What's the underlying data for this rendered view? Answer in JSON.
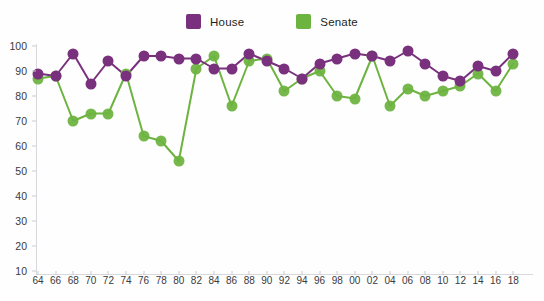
{
  "legend": {
    "entries": [
      {
        "label": "House",
        "color": "#79307d",
        "icon": "square-swatch-icon"
      },
      {
        "label": "Senate",
        "color": "#6db33f",
        "icon": "square-swatch-icon"
      }
    ]
  },
  "axes": {
    "y_ticks": [
      "100",
      "90",
      "80",
      "70",
      "60",
      "50",
      "40",
      "30",
      "20",
      "10"
    ],
    "x_ticks": [
      "64",
      "66",
      "68",
      "70",
      "72",
      "74",
      "76",
      "78",
      "80",
      "82",
      "84",
      "86",
      "88",
      "90",
      "92",
      "94",
      "96",
      "98",
      "00",
      "02",
      "04",
      "06",
      "08",
      "10",
      "12",
      "14",
      "16",
      "18"
    ]
  },
  "chart_data": {
    "type": "line",
    "title": "",
    "subtitle": "",
    "xlabel": "",
    "ylabel": "",
    "xlim": [
      64,
      18
    ],
    "ylim": [
      0,
      100
    ],
    "y_tick_values": [
      100,
      90,
      80,
      70,
      60,
      50,
      40,
      30,
      20,
      10
    ],
    "grid": false,
    "legend_position": "top-center",
    "markers": "filled-circle",
    "categories": [
      "64",
      "66",
      "68",
      "70",
      "72",
      "74",
      "76",
      "78",
      "80",
      "82",
      "84",
      "86",
      "88",
      "90",
      "92",
      "94",
      "96",
      "98",
      "00",
      "02",
      "04",
      "06",
      "08",
      "10",
      "12",
      "14",
      "16",
      "18"
    ],
    "series": [
      {
        "name": "House",
        "color": "#79307d",
        "values": [
          89,
          88,
          97,
          85,
          94,
          88,
          96,
          96,
          95,
          95,
          91,
          91,
          97,
          94,
          91,
          87,
          93,
          95,
          97,
          96,
          94,
          98,
          93,
          88,
          86,
          92,
          90,
          97
        ]
      },
      {
        "name": "Senate",
        "color": "#6db33f",
        "values": [
          87,
          88,
          70,
          73,
          73,
          89,
          64,
          62,
          54,
          91,
          96,
          76,
          94,
          95,
          82,
          87,
          90,
          80,
          79,
          96,
          76,
          83,
          80,
          82,
          84,
          89,
          82,
          93
        ]
      }
    ]
  }
}
